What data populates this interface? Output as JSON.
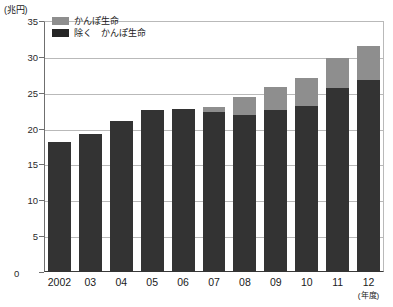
{
  "chart_data": {
    "type": "bar",
    "title": "",
    "subtitle": "",
    "stacked": true,
    "unit_label": "(兆円)",
    "xlabel": "(年度)",
    "ylabel": "",
    "ylim": [
      0,
      35
    ],
    "yticks": [
      0,
      5,
      10,
      15,
      20,
      25,
      30,
      35
    ],
    "ytick_labels": [
      "0",
      "5",
      "10",
      "15",
      "20",
      "25",
      "30",
      "35"
    ],
    "grid": true,
    "grid_axis": "y",
    "legend_position": "top-left",
    "categories": [
      "2002",
      "03",
      "04",
      "05",
      "06",
      "07",
      "08",
      "09",
      "10",
      "11",
      "12"
    ],
    "series": [
      {
        "name": "除く　かんぽ生命",
        "color": "#333333",
        "values": [
          18.1,
          19.2,
          21.0,
          22.6,
          22.7,
          22.3,
          21.9,
          22.6,
          23.2,
          25.7,
          26.8
        ]
      },
      {
        "name": "かんぽ生命",
        "color": "#8e8e8e",
        "values": [
          0.0,
          0.0,
          0.0,
          0.0,
          0.0,
          0.7,
          2.5,
          3.2,
          3.9,
          4.1,
          4.7
        ]
      }
    ],
    "totals": [
      18.1,
      19.2,
      21.0,
      22.6,
      22.7,
      23.0,
      24.4,
      25.8,
      27.1,
      29.8,
      31.5
    ]
  },
  "legend": {
    "items": [
      {
        "label": "かんぽ生命",
        "swatch": "top"
      },
      {
        "label": "除く　かんぽ生命",
        "swatch": "base"
      }
    ]
  },
  "axis": {
    "unit": "(兆円)",
    "x_note": "(年度)",
    "zero": "0"
  },
  "colors": {
    "series_top": "#8e8e8e",
    "series_base": "#333333",
    "gridline": "#b9b9b9",
    "axis": "#3a3a3a",
    "background": "#ffffff"
  }
}
